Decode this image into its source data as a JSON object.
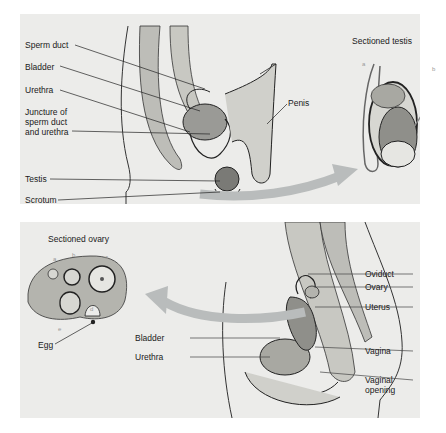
{
  "male_diagram": {
    "labels": {
      "sperm_duct": "Sperm duct",
      "bladder": "Bladder",
      "urethra": "Urethra",
      "juncture_1": "Juncture of",
      "juncture_2": "sperm duct",
      "juncture_3": "and urethra",
      "testis": "Testis",
      "scrotum": "Scrotum",
      "penis": "Penis"
    },
    "inset_title": "Sectioned testis",
    "inset_letters": {
      "a": "a",
      "b": "b"
    }
  },
  "female_diagram": {
    "labels": {
      "oviduct": "Oviduct",
      "ovary": "Ovary",
      "uterus": "Uterus",
      "bladder": "Bladder",
      "urethra": "Urethra",
      "vagina": "Vagina",
      "vaginal_opening_1": "Vaginal",
      "vaginal_opening_2": "opening"
    },
    "inset_title": "Sectioned ovary",
    "inset_letters": {
      "a": "a",
      "b": "b",
      "c": "c",
      "d": "d",
      "e": "e"
    },
    "egg_label": "Egg"
  },
  "colors": {
    "panel": "#ececea",
    "arrow": "#b9bcbc",
    "line": "#222222"
  }
}
